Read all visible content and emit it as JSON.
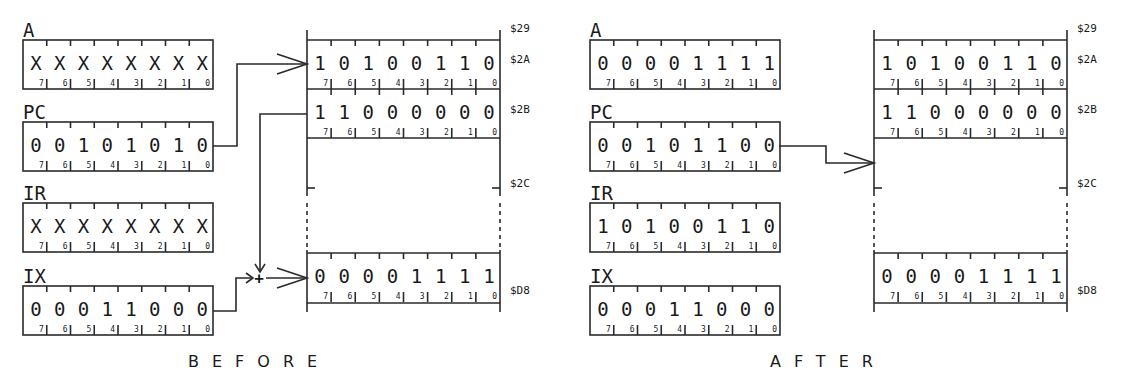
{
  "panels": [
    {
      "id": "before",
      "caption": "BEFORE",
      "caption_x": 188,
      "offset_x": 0,
      "registers": [
        {
          "name": "A",
          "bits": [
            "X",
            "X",
            "X",
            "X",
            "X",
            "X",
            "X",
            "X"
          ]
        },
        {
          "name": "PC",
          "bits": [
            "0",
            "0",
            "1",
            "0",
            "1",
            "0",
            "1",
            "0"
          ]
        },
        {
          "name": "IR",
          "bits": [
            "X",
            "X",
            "X",
            "X",
            "X",
            "X",
            "X",
            "X"
          ]
        },
        {
          "name": "IX",
          "bits": [
            "0",
            "0",
            "0",
            "1",
            "1",
            "0",
            "0",
            "0"
          ]
        }
      ],
      "memory": [
        {
          "address": "$2A",
          "bits": [
            "1",
            "0",
            "1",
            "0",
            "0",
            "1",
            "1",
            "0"
          ]
        },
        {
          "address": "$2B",
          "bits": [
            "1",
            "1",
            "0",
            "0",
            "0",
            "0",
            "0",
            "0"
          ]
        },
        {
          "address": "$D8",
          "bits": [
            "0",
            "0",
            "0",
            "0",
            "1",
            "1",
            "1",
            "1"
          ]
        }
      ],
      "memory_labels": [
        "$29",
        "$2A",
        "$2B",
        "$2C",
        "$D8"
      ],
      "pointer": "PC -> $2A; $2B + IX -> $D8",
      "adder_symbol": "+"
    },
    {
      "id": "after",
      "caption": "AFTER",
      "caption_x": 770,
      "offset_x": 567,
      "registers": [
        {
          "name": "A",
          "bits": [
            "0",
            "0",
            "0",
            "0",
            "1",
            "1",
            "1",
            "1"
          ]
        },
        {
          "name": "PC",
          "bits": [
            "0",
            "0",
            "1",
            "0",
            "1",
            "1",
            "0",
            "0"
          ]
        },
        {
          "name": "IR",
          "bits": [
            "1",
            "0",
            "1",
            "0",
            "0",
            "1",
            "1",
            "0"
          ]
        },
        {
          "name": "IX",
          "bits": [
            "0",
            "0",
            "0",
            "1",
            "1",
            "0",
            "0",
            "0"
          ]
        }
      ],
      "memory": [
        {
          "address": "$2A",
          "bits": [
            "1",
            "0",
            "1",
            "0",
            "0",
            "1",
            "1",
            "0"
          ]
        },
        {
          "address": "$2B",
          "bits": [
            "1",
            "1",
            "0",
            "0",
            "0",
            "0",
            "0",
            "0"
          ]
        },
        {
          "address": "$D8",
          "bits": [
            "0",
            "0",
            "0",
            "0",
            "1",
            "1",
            "1",
            "1"
          ]
        }
      ],
      "memory_labels": [
        "$29",
        "$2A",
        "$2B",
        "$2C",
        "$D8"
      ],
      "pointer": "PC -> $2C"
    }
  ],
  "bit_indices": [
    "7",
    "6",
    "5",
    "4",
    "3",
    "2",
    "1",
    "0"
  ]
}
